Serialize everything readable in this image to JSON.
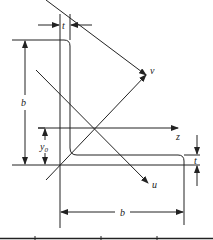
{
  "diagram": {
    "labels": {
      "thickness_top": "t",
      "leg_height": "b",
      "axis_v": "v",
      "axis_z": "z",
      "axis_u": "u",
      "centroid_offset": "y",
      "centroid_offset_sub": "0",
      "thickness_right": "t",
      "leg_width": "b"
    },
    "colors": {
      "stroke": "#222222",
      "background": "#ffffff"
    }
  }
}
